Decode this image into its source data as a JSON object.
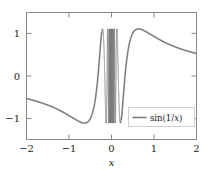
{
  "chart_data": {
    "type": "line",
    "title": "",
    "xlabel": "x",
    "ylabel": "",
    "xlim": [
      -2,
      2
    ],
    "ylim": [
      -1.35,
      1.35
    ],
    "xticks": [
      -2,
      -1,
      0,
      1,
      2
    ],
    "xtick_labels": [
      "−2",
      "−1",
      "0",
      "1",
      "2"
    ],
    "yticks": [
      -1,
      0,
      1
    ],
    "ytick_labels": [
      "−1",
      "0",
      "1"
    ],
    "grid": false,
    "legend_position": "lower right",
    "legend": [
      "sin(1/x)"
    ],
    "series": [
      {
        "name": "sin(1/x)",
        "color": "#808080",
        "linewidth": 1.6,
        "formula": "y = sin(1/x)",
        "sampled_points": [
          {
            "x": -2.0,
            "y": -0.479
          },
          {
            "x": -1.8,
            "y": -0.527
          },
          {
            "x": -1.6,
            "y": -0.585
          },
          {
            "x": -1.4,
            "y": -0.655
          },
          {
            "x": -1.2,
            "y": -0.74
          },
          {
            "x": -1.0,
            "y": -0.841
          },
          {
            "x": -0.9,
            "y": -0.896
          },
          {
            "x": -0.8,
            "y": -0.949
          },
          {
            "x": -0.7,
            "y": -0.99
          },
          {
            "x": -0.637,
            "y": -1.0
          },
          {
            "x": -0.6,
            "y": -0.996
          },
          {
            "x": -0.5,
            "y": -0.909
          },
          {
            "x": -0.45,
            "y": -0.791
          },
          {
            "x": -0.4,
            "y": -0.598
          },
          {
            "x": -0.35,
            "y": -0.295
          },
          {
            "x": -0.32,
            "y": -0.047
          },
          {
            "x": -0.3,
            "y": 0.191
          },
          {
            "x": -0.28,
            "y": 0.475
          },
          {
            "x": -0.26,
            "y": 0.769
          },
          {
            "x": -0.24,
            "y": 0.974
          },
          {
            "x": -0.22,
            "y": 0.989
          },
          {
            "x": -0.21,
            "y": 0.899
          },
          {
            "x": -0.2,
            "y": 0.717
          },
          {
            "x": -0.19,
            "y": 0.432
          },
          {
            "x": -0.18,
            "y": 0.045
          },
          {
            "x": -0.17,
            "y": -0.411
          },
          {
            "x": -0.16,
            "y": -0.831
          },
          {
            "x": -0.15,
            "y": -0.997
          },
          {
            "x": -0.14,
            "y": -0.721
          },
          {
            "x": -0.13,
            "y": 0.037
          },
          {
            "x": -0.12,
            "y": 0.877
          },
          {
            "x": -0.11,
            "y": 0.816
          },
          {
            "x": -0.1,
            "y": -0.544
          },
          {
            "x": 0.1,
            "y": 0.544
          },
          {
            "x": 0.11,
            "y": -0.816
          },
          {
            "x": 0.12,
            "y": -0.877
          },
          {
            "x": 0.13,
            "y": -0.037
          },
          {
            "x": 0.14,
            "y": 0.721
          },
          {
            "x": 0.15,
            "y": 0.997
          },
          {
            "x": 0.16,
            "y": 0.831
          },
          {
            "x": 0.17,
            "y": 0.411
          },
          {
            "x": 0.18,
            "y": -0.045
          },
          {
            "x": 0.19,
            "y": -0.432
          },
          {
            "x": 0.2,
            "y": -0.717
          },
          {
            "x": 0.21,
            "y": -0.899
          },
          {
            "x": 0.22,
            "y": -0.989
          },
          {
            "x": 0.24,
            "y": -0.974
          },
          {
            "x": 0.26,
            "y": -0.769
          },
          {
            "x": 0.28,
            "y": -0.475
          },
          {
            "x": 0.3,
            "y": -0.191
          },
          {
            "x": 0.32,
            "y": 0.047
          },
          {
            "x": 0.35,
            "y": 0.295
          },
          {
            "x": 0.4,
            "y": 0.598
          },
          {
            "x": 0.45,
            "y": 0.791
          },
          {
            "x": 0.5,
            "y": 0.909
          },
          {
            "x": 0.6,
            "y": 0.996
          },
          {
            "x": 0.637,
            "y": 1.0
          },
          {
            "x": 0.7,
            "y": 0.99
          },
          {
            "x": 0.8,
            "y": 0.949
          },
          {
            "x": 0.9,
            "y": 0.896
          },
          {
            "x": 1.0,
            "y": 0.841
          },
          {
            "x": 1.2,
            "y": 0.74
          },
          {
            "x": 1.4,
            "y": 0.655
          },
          {
            "x": 1.6,
            "y": 0.585
          },
          {
            "x": 1.8,
            "y": 0.527
          },
          {
            "x": 2.0,
            "y": 0.479
          }
        ],
        "notes": "Dense oscillation region approximately -0.23 < x < 0.23 fills band between y=-1 and y=1"
      }
    ]
  },
  "axes": {
    "xtick_0": "−2",
    "xtick_1": "−1",
    "xtick_2": "0",
    "xtick_3": "1",
    "xtick_4": "2",
    "ytick_0": "1",
    "ytick_1": "0",
    "ytick_2": "−1",
    "xlabel": "x"
  },
  "legend": {
    "entry_prefix": "sin(1/",
    "entry_var": "x",
    "entry_suffix": ")",
    "full_label": "sin(1/x)"
  },
  "colors": {
    "curve": "#808080",
    "frame": "#8a8a8a",
    "text": "#1a1a1a",
    "legend_border": "#c8c8c8",
    "background": "#ffffff"
  }
}
